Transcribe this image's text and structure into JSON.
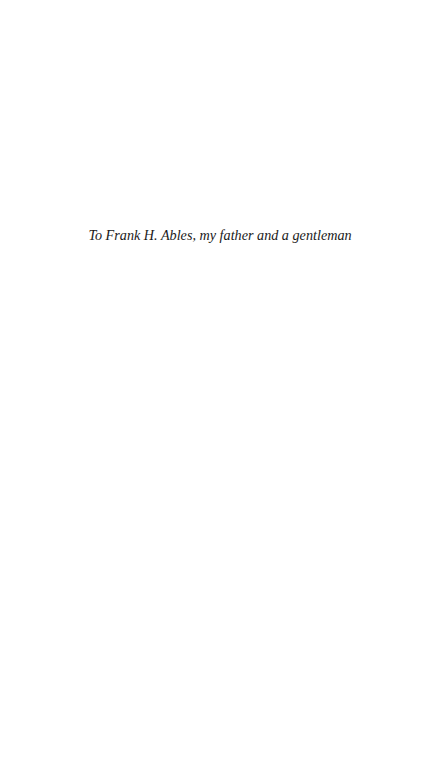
{
  "page": {
    "background_color": "#ffffff",
    "text_color": "#1a1a1a"
  },
  "dedication": {
    "text": "To Frank H. Ables, my father and a gentleman"
  }
}
